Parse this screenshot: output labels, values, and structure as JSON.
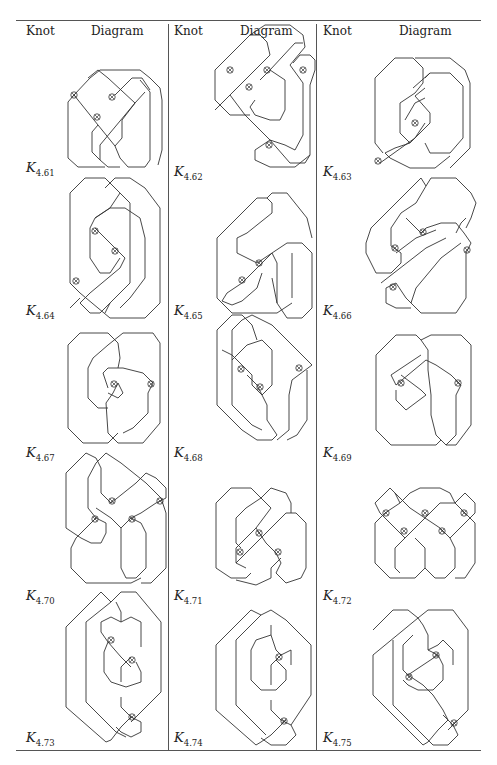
{
  "table": {
    "headers": [
      {
        "knot": "Knot",
        "diagram": "Diagram"
      },
      {
        "knot": "Knot",
        "diagram": "Diagram"
      },
      {
        "knot": "Knot",
        "diagram": "Diagram"
      }
    ],
    "rows": [
      [
        {
          "knot": "K",
          "sub": "4.61",
          "virtual_crossings": 3
        },
        {
          "knot": "K",
          "sub": "4.62",
          "virtual_crossings": 4
        },
        {
          "knot": "K",
          "sub": "4.63",
          "virtual_crossings": 2
        }
      ],
      [
        {
          "knot": "K",
          "sub": "4.64",
          "virtual_crossings": 3
        },
        {
          "knot": "K",
          "sub": "4.65",
          "virtual_crossings": 2
        },
        {
          "knot": "K",
          "sub": "4.66",
          "virtual_crossings": 4
        }
      ],
      [
        {
          "knot": "K",
          "sub": "4.67",
          "virtual_crossings": 2
        },
        {
          "knot": "K",
          "sub": "4.68",
          "virtual_crossings": 3
        },
        {
          "knot": "K",
          "sub": "4.69",
          "virtual_crossings": 2
        }
      ],
      [
        {
          "knot": "K",
          "sub": "4.70",
          "virtual_crossings": 4
        },
        {
          "knot": "K",
          "sub": "4.71",
          "virtual_crossings": 3
        },
        {
          "knot": "K",
          "sub": "4.72",
          "virtual_crossings": 5
        }
      ],
      [
        {
          "knot": "K",
          "sub": "4.73",
          "virtual_crossings": 3
        },
        {
          "knot": "K",
          "sub": "4.74",
          "virtual_crossings": 2
        },
        {
          "knot": "K",
          "sub": "4.75",
          "virtual_crossings": 3
        }
      ]
    ]
  }
}
